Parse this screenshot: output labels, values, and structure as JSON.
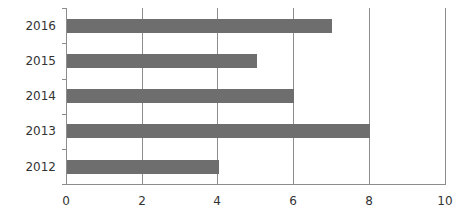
{
  "chart_data": {
    "type": "bar",
    "orientation": "horizontal",
    "title": "",
    "xlabel": "",
    "ylabel": "",
    "categories": [
      "2016",
      "2015",
      "2014",
      "2013",
      "2012"
    ],
    "values": [
      7,
      5,
      6,
      8,
      4
    ],
    "xlim": [
      0,
      10
    ],
    "xticks": [
      "0",
      "2",
      "4",
      "6",
      "8",
      "10"
    ],
    "grid": true,
    "legend": null,
    "bar_color": "#6e6e6e"
  }
}
